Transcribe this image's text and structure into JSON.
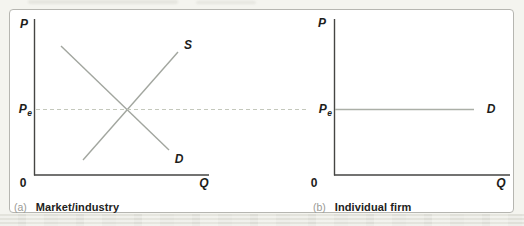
{
  "figure": {
    "colors": {
      "axis": "#454543",
      "curve": "#a2a69f",
      "firm_demand_line": "#abafa7",
      "dashed_equilibrium": "#c4c8bc",
      "label_text": "#1d1d1b",
      "caption_tag": "#9a9a95",
      "frame_border": "#b6b6b1",
      "figure_background": "#ffffff",
      "page_background": "#f4f4ef"
    },
    "panels": [
      {
        "tag": "(a)",
        "caption": "Market/industry",
        "p_axis": "P",
        "q_axis": "Q",
        "origin": "0",
        "pe_base": "P",
        "pe_sub": "e",
        "supply_label": "S",
        "demand_label": "D"
      },
      {
        "tag": "(b)",
        "caption": "Individual firm",
        "p_axis": "P",
        "q_axis": "Q",
        "origin": "0",
        "pe_base": "P",
        "pe_sub": "e",
        "demand_label": "D"
      }
    ]
  }
}
